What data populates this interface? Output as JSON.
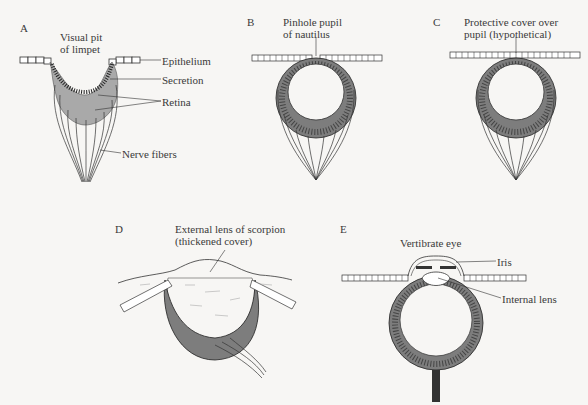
{
  "panels": {
    "A": {
      "letter": "A",
      "title_line1": "Visual pit",
      "title_line2": "of limpet",
      "labels": {
        "epithelium": "Epithelium",
        "secretion": "Secretion",
        "retina": "Retina",
        "nerve_fibers": "Nerve fibers"
      }
    },
    "B": {
      "letter": "B",
      "title_line1": "Pinhole pupil",
      "title_line2": "of nautilus"
    },
    "C": {
      "letter": "C",
      "title_line1": "Protective cover over",
      "title_line2": "pupil (hypothetical)"
    },
    "D": {
      "letter": "D",
      "title_line1": "External lens of scorpion",
      "title_line2": "(thickened cover)"
    },
    "E": {
      "letter": "E",
      "title": "Vertibrate eye",
      "labels": {
        "iris": "Iris",
        "internal_lens": "Internal lens"
      }
    }
  },
  "colors": {
    "background": "#f7f6f4",
    "ink": "#333333",
    "secretion_fill": "#b5b5b5",
    "retina_fill": "#8a8a8a"
  }
}
